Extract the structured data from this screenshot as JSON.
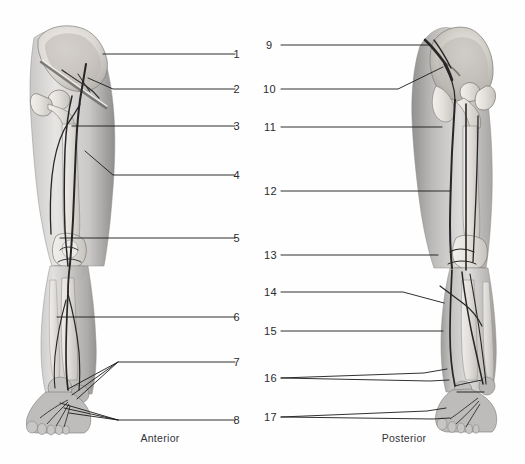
{
  "figure": {
    "background_color": "#fefefe",
    "line_color": "#1a1a1a",
    "label_color": "#2b2b2b",
    "limb_fill_light": "#d8d6d4",
    "limb_fill_mid": "#b9b7b5",
    "limb_fill_dark": "#8f8d8c",
    "bone_fill": "#e9e7e4",
    "vessel_color": "#2a2a2a"
  },
  "views": [
    {
      "id": "anterior",
      "caption": "Anterior",
      "caption_x": 160,
      "caption_y": 437
    },
    {
      "id": "posterior",
      "caption": "Posterior",
      "caption_x": 404,
      "caption_y": 437
    }
  ],
  "callouts": {
    "anterior_numbers": [
      {
        "number": "1",
        "label_x": 241,
        "label_y": 54
      },
      {
        "number": "2",
        "label_x": 241,
        "label_y": 89
      },
      {
        "number": "3",
        "label_x": 241,
        "label_y": 126
      },
      {
        "number": "4",
        "label_x": 241,
        "label_y": 175
      },
      {
        "number": "5",
        "label_x": 241,
        "label_y": 238
      },
      {
        "number": "6",
        "label_x": 241,
        "label_y": 317
      },
      {
        "number": "7",
        "label_x": 241,
        "label_y": 362
      },
      {
        "number": "8",
        "label_x": 241,
        "label_y": 420
      }
    ],
    "posterior_numbers": [
      {
        "number": "9",
        "label_x": 266,
        "label_y": 45
      },
      {
        "number": "10",
        "label_x": 266,
        "label_y": 89
      },
      {
        "number": "11",
        "label_x": 266,
        "label_y": 127
      },
      {
        "number": "12",
        "label_x": 266,
        "label_y": 191
      },
      {
        "number": "13",
        "label_x": 266,
        "label_y": 255
      },
      {
        "number": "14",
        "label_x": 266,
        "label_y": 292
      },
      {
        "number": "15",
        "label_x": 266,
        "label_y": 331
      },
      {
        "number": "16",
        "label_x": 266,
        "label_y": 378
      },
      {
        "number": "17",
        "label_x": 266,
        "label_y": 417
      }
    ]
  },
  "leader_lines": {
    "anterior": [
      {
        "number": "1",
        "points": "235,54 103,54"
      },
      {
        "number": "2",
        "points": "235,89 113,89 88,78"
      },
      {
        "number": "3",
        "points": "235,126 72,126"
      },
      {
        "number": "4",
        "points": "235,175 113,175 85,151"
      },
      {
        "number": "5",
        "points": "235,238 60,238"
      },
      {
        "number": "6",
        "points": "235,317 57,317"
      },
      {
        "number": "7a",
        "points": "235,362 118,362 68,389"
      },
      {
        "number": "7b",
        "points": "118,362 72,395"
      },
      {
        "number": "7c",
        "points": "118,362 76,398"
      },
      {
        "number": "8a",
        "points": "235,420 118,420 60,404"
      },
      {
        "number": "8b",
        "points": "118,420 64,408"
      },
      {
        "number": "8c",
        "points": "118,420 68,412"
      }
    ],
    "posterior": [
      {
        "number": "9",
        "points": "281,45 430,45"
      },
      {
        "number": "10",
        "points": "281,89 398,89 443,67"
      },
      {
        "number": "11",
        "points": "281,127 442,127"
      },
      {
        "number": "12",
        "points": "281,191 450,191"
      },
      {
        "number": "13",
        "points": "281,255 438,255"
      },
      {
        "number": "14",
        "points": "281,292 403,292 444,303"
      },
      {
        "number": "15",
        "points": "281,331 443,331"
      },
      {
        "number": "16a",
        "points": "281,378 425,374 447,370"
      },
      {
        "number": "16b",
        "points": "281,378 430,380 448,379"
      },
      {
        "number": "17a",
        "points": "281,417 428,412 446,409"
      },
      {
        "number": "17b",
        "points": "281,417 432,419 449,417"
      }
    ]
  }
}
